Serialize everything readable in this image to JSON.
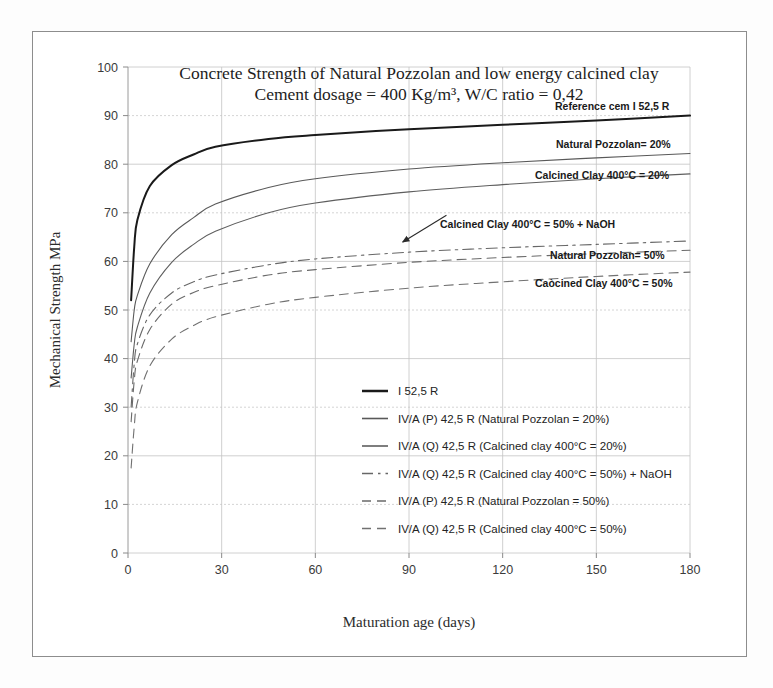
{
  "chart_data": {
    "type": "line",
    "title": "Concrete Strength of Natural Pozzolan and low energy calcined clay",
    "subtitle": "Cement dosage = 400 Kg/m³, W/C ratio = 0,42",
    "xlabel": "Maturation age (days)",
    "ylabel": "Mechanical Strength MPa",
    "xlim": [
      0,
      180
    ],
    "ylim": [
      0,
      100
    ],
    "xticks": [
      0,
      30,
      60,
      90,
      120,
      150,
      180
    ],
    "yticks": [
      0,
      10,
      20,
      30,
      40,
      50,
      60,
      70,
      80,
      90,
      100
    ],
    "grid": true,
    "legend_position": "inside-lower-center",
    "series": [
      {
        "name": "I 52,5 R",
        "legend_label": "I 52,5 R",
        "curve_label": "Reference cem I 52,5 R",
        "color": "#1a1a1a",
        "width": 2.0,
        "dash": "none",
        "x": [
          1,
          2,
          3,
          7,
          14,
          21,
          28,
          45,
          60,
          90,
          120,
          150,
          180
        ],
        "y": [
          52,
          63,
          68.5,
          75.5,
          79.8,
          82.0,
          83.6,
          85.2,
          86.0,
          87.2,
          88.1,
          89.0,
          90.0
        ]
      },
      {
        "name": "IV/A (P) 42,5 R (Natural Pozzolan = 20%)",
        "legend_label": "IV/A (P) 42,5 R  (Natural Pozzolan = 20%)",
        "curve_label": "Natural Pozzolan= 20%",
        "color": "#595959",
        "width": 1.1,
        "dash": "none",
        "x": [
          1,
          2,
          3,
          7,
          14,
          21,
          28,
          45,
          60,
          90,
          120,
          150,
          180
        ],
        "y": [
          43.5,
          50.0,
          53.0,
          59.5,
          65.5,
          69.0,
          71.8,
          75.2,
          77.0,
          79.0,
          80.3,
          81.3,
          82.2
        ]
      },
      {
        "name": "IV/A (Q) 42,5 R (Calcined clay 400°C = 20%)",
        "legend_label": "IV/A (Q) 42,5 R  (Calcined clay 400°C = 20%)",
        "curve_label": "Calcined Clay 400°C = 20%",
        "color": "#5e5e5e",
        "width": 1.1,
        "dash": "none",
        "x": [
          1,
          2,
          3,
          7,
          14,
          21,
          28,
          45,
          60,
          90,
          120,
          150,
          180
        ],
        "y": [
          36.0,
          43.0,
          46.5,
          53.5,
          59.8,
          63.5,
          66.2,
          70.0,
          72.0,
          74.3,
          75.8,
          77.0,
          78.0
        ]
      },
      {
        "name": "IV/A (Q) 42,5 R (Calcined clay 400°C = 50%) + NaOH",
        "legend_label": "IV/A (Q) 42,5 R  (Calcined clay 400°C = 50%) + NaOH",
        "curve_label": "Calcined Clay 400°C = 50% + NaOH",
        "color": "#676767",
        "width": 1.1,
        "dash": "dashdot",
        "x": [
          1,
          2,
          3,
          7,
          14,
          21,
          28,
          45,
          60,
          90,
          120,
          150,
          180
        ],
        "y": [
          30.0,
          39.0,
          43.0,
          49.0,
          53.5,
          55.8,
          57.2,
          59.3,
          60.5,
          61.9,
          62.8,
          63.5,
          64.2
        ]
      },
      {
        "name": "IV/A (P) 42,5 R (Natural Pozzolan = 50%)",
        "legend_label": "IV/A (P) 42,5 R  (Natural Pozzolan = 50%)",
        "curve_label": "Natural Pozzolan= 50%",
        "color": "#6a6a6a",
        "width": 1.1,
        "dash": "dash-long",
        "x": [
          1,
          2,
          3,
          7,
          14,
          21,
          28,
          45,
          60,
          90,
          120,
          150,
          180
        ],
        "y": [
          27.0,
          35.5,
          39.5,
          46.0,
          51.2,
          53.6,
          55.0,
          57.2,
          58.3,
          59.8,
          60.8,
          61.6,
          62.3
        ]
      },
      {
        "name": "IV/A (Q) 42,5 R (Calcined clay 400°C = 50%)",
        "legend_label": "IV/A (Q) 42,5 R  (Calcined clay 400°C = 50%)",
        "curve_label": "Caòcined Clay 400°C = 50%",
        "color": "#717171",
        "width": 1.1,
        "dash": "dash-long",
        "x": [
          1,
          2,
          3,
          7,
          14,
          21,
          28,
          45,
          60,
          90,
          120,
          150,
          180
        ],
        "y": [
          17.5,
          26.0,
          31.0,
          38.5,
          44.0,
          46.8,
          48.6,
          51.2,
          52.6,
          54.5,
          55.8,
          56.9,
          57.8
        ]
      }
    ],
    "annotations": [
      {
        "name": "naoh-arrow",
        "text": "",
        "type": "arrow",
        "from_x": 102,
        "from_y": 69.5,
        "to_x": 88,
        "to_y": 64.0
      }
    ],
    "curve_labels": [
      {
        "text": "Reference cem I 52,5 R",
        "x_px": 555,
        "y_px": 110
      },
      {
        "text": "Natural Pozzolan= 20%",
        "x_px": 556,
        "y_px": 148
      },
      {
        "text": "Calcined Clay 400°C = 20%",
        "x_px": 535,
        "y_px": 179
      },
      {
        "text": "Calcined Clay 400°C = 50% + NaOH",
        "x_px": 440,
        "y_px": 228
      },
      {
        "text": "Natural Pozzolan= 50%",
        "x_px": 550,
        "y_px": 259
      },
      {
        "text": "Caòcined Clay 400°C = 50%",
        "x_px": 535,
        "y_px": 287
      }
    ]
  }
}
